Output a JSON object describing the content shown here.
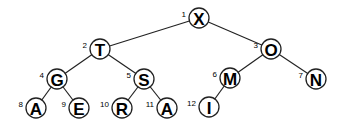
{
  "diagram": {
    "type": "binary-tree",
    "node_radius": 10,
    "nodes": [
      {
        "index": "1",
        "label": "X",
        "x": 199,
        "y": 18
      },
      {
        "index": "2",
        "label": "T",
        "x": 100,
        "y": 49
      },
      {
        "index": "3",
        "label": "O",
        "x": 271,
        "y": 49
      },
      {
        "index": "4",
        "label": "G",
        "x": 57,
        "y": 79
      },
      {
        "index": "5",
        "label": "S",
        "x": 144,
        "y": 79
      },
      {
        "index": "6",
        "label": "M",
        "x": 230,
        "y": 78
      },
      {
        "index": "7",
        "label": "N",
        "x": 316,
        "y": 79
      },
      {
        "index": "8",
        "label": "A",
        "x": 36,
        "y": 108
      },
      {
        "index": "9",
        "label": "E",
        "x": 79,
        "y": 108
      },
      {
        "index": "10",
        "label": "R",
        "x": 122,
        "y": 108
      },
      {
        "index": "11",
        "label": "A",
        "x": 167,
        "y": 108
      },
      {
        "index": "12",
        "label": "I",
        "x": 209,
        "y": 107
      }
    ],
    "edges": [
      [
        "1",
        "2"
      ],
      [
        "1",
        "3"
      ],
      [
        "2",
        "4"
      ],
      [
        "2",
        "5"
      ],
      [
        "3",
        "6"
      ],
      [
        "3",
        "7"
      ],
      [
        "4",
        "8"
      ],
      [
        "4",
        "9"
      ],
      [
        "5",
        "10"
      ],
      [
        "5",
        "11"
      ],
      [
        "6",
        "12"
      ]
    ]
  }
}
